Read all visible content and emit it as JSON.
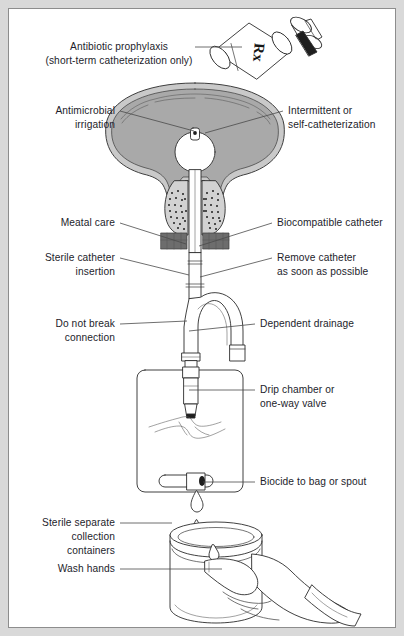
{
  "figure": {
    "frame_color": "#8d8d8d",
    "background_color": "#ffffff",
    "outer_margin_color": "#d9d9d9",
    "ink_color": "#2b2b2b",
    "label_color": "#1d1d2b",
    "leader_color": "#4a4a4a",
    "bladder_lumen_color": "#a9a9a9",
    "bladder_wall_color": "#c9c9c9"
  },
  "labels": {
    "antibiotic_line1": "Antibiotic prophylaxis",
    "antibiotic_line2": "(short-term catheterization only)",
    "antimicrobial_line1": "Antimicrobial",
    "antimicrobial_line2": "irrigation",
    "intermittent_line1": "Intermittent or",
    "intermittent_line2": "self-catheterization",
    "meatal_care": "Meatal care",
    "biocompatible": "Biocompatible catheter",
    "sterile_insertion_line1": "Sterile catheter",
    "sterile_insertion_line2": "insertion",
    "remove_line1": "Remove catheter",
    "remove_line2": "as soon as possible",
    "do_not_break_line1": "Do not break",
    "do_not_break_line2": "connection",
    "dependent_drainage": "Dependent drainage",
    "drip_chamber_line1": "Drip chamber or",
    "drip_chamber_line2": "one-way valve",
    "biocide": "Biocide to bag or spout",
    "sterile_containers_line1": "Sterile separate",
    "sterile_containers_line2": "collection",
    "sterile_containers_line3": "containers",
    "wash_hands": "Wash hands"
  },
  "illustration": {
    "pill_bottle_label": "Rx",
    "parts": [
      "pill-bottle",
      "bladder",
      "prostate",
      "urethra",
      "catheter-tube",
      "y-junction",
      "balloon-port",
      "drainage-bag",
      "drip-chamber",
      "bag-spout",
      "urine-drop",
      "collection-container",
      "gloved-hand"
    ]
  }
}
